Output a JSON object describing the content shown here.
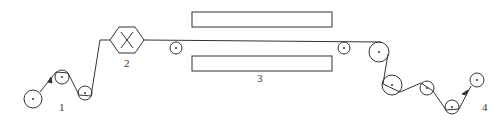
{
  "diagram": {
    "type": "web-path process diagram (rollers, device, heaters)",
    "colors": {
      "line": "#333333",
      "background": "#ffffff"
    },
    "labels": [
      {
        "id": "1",
        "text": "1",
        "x": 62,
        "y": 111
      },
      {
        "id": "2",
        "text": "2",
        "x": 127,
        "y": 67
      },
      {
        "id": "3",
        "text": "3",
        "x": 260,
        "y": 82
      },
      {
        "id": "4",
        "text": "4",
        "x": 485,
        "y": 111
      }
    ],
    "rollers": [
      {
        "name": "unwind-roller",
        "cx": 33,
        "cy": 99,
        "r": 9
      },
      {
        "name": "guide-roller-1",
        "cx": 62,
        "cy": 77,
        "r": 7
      },
      {
        "name": "guide-roller-2",
        "cx": 85,
        "cy": 93,
        "r": 7
      },
      {
        "name": "guide-roller-3",
        "cx": 176,
        "cy": 48,
        "r": 6
      },
      {
        "name": "guide-roller-4",
        "cx": 344,
        "cy": 48,
        "r": 6
      },
      {
        "name": "guide-roller-5",
        "cx": 379,
        "cy": 52,
        "r": 10
      },
      {
        "name": "guide-roller-6",
        "cx": 392,
        "cy": 85,
        "r": 10
      },
      {
        "name": "guide-roller-7",
        "cx": 427,
        "cy": 88,
        "r": 7
      },
      {
        "name": "guide-roller-8",
        "cx": 452,
        "cy": 107,
        "r": 7
      },
      {
        "name": "rewind-roller",
        "cx": 477,
        "cy": 80,
        "r": 7
      }
    ],
    "device": {
      "name": "hexagon-unit",
      "cx": 127,
      "cy": 40,
      "w": 34,
      "h": 26,
      "symbol": "X"
    },
    "plates": [
      {
        "name": "upper-heater-plate",
        "x": 192,
        "y": 12,
        "w": 140,
        "h": 15
      },
      {
        "name": "lower-heater-plate",
        "x": 192,
        "y": 56,
        "w": 140,
        "h": 15
      }
    ]
  }
}
